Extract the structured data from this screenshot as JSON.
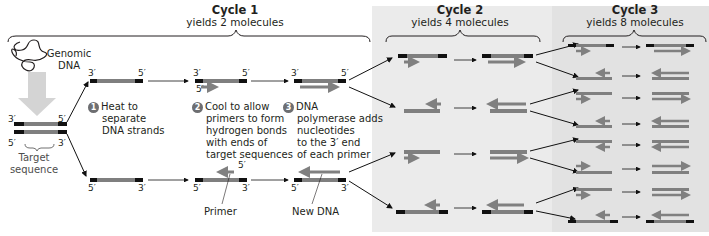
{
  "figure": {
    "cycles": [
      {
        "title": "Cycle 1",
        "subtitle": "yields 2 molecules"
      },
      {
        "title": "Cycle 2",
        "subtitle": "yields 4 molecules"
      },
      {
        "title": "Cycle 3",
        "subtitle": "yields 8 molecules"
      }
    ],
    "labels": {
      "genomic_dna": "Genomic\nDNA",
      "genomic_line1": "Genomic",
      "genomic_line2": "DNA",
      "target_line1": "Target",
      "target_line2": "sequence",
      "primer": "Primer",
      "new_dna": "New DNA"
    },
    "steps": [
      {
        "number": "1",
        "lines": [
          "Heat to",
          "separate",
          "DNA strands"
        ]
      },
      {
        "number": "2",
        "lines": [
          "Cool to allow",
          "primers to form",
          "hydrogen bonds",
          "with ends of",
          "target sequences"
        ]
      },
      {
        "number": "3",
        "lines": [
          "DNA",
          "polymerase adds",
          "nucleotides",
          "to the 3′ end",
          "of each primer"
        ]
      }
    ],
    "strand_ends": {
      "three_prime": "3′",
      "five_prime": "5′"
    },
    "colors": {
      "strand_gray": "#7f7f7f",
      "strand_end_black": "#111111",
      "new_dna_gray": "#808080",
      "step_badge": "#6d6e71",
      "cycle2_bg": "#ebebeb",
      "cycle3_bg": "#e2e2e2"
    }
  }
}
